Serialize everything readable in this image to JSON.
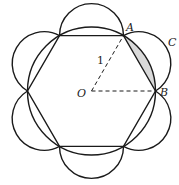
{
  "diagram": {
    "center": {
      "x": 91.5,
      "y": 91
    },
    "radius": 64,
    "stroke_color": "#1a1a1a",
    "shade_color": "#d9d9d9",
    "labels": {
      "A": "A",
      "B": "B",
      "C": "C",
      "O": "O",
      "radius_label": "1"
    }
  }
}
